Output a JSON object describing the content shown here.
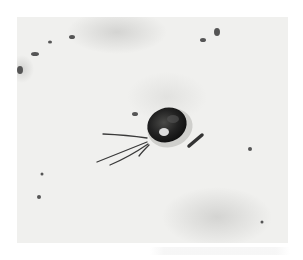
{
  "image": {
    "subject": "micrograph of a single-celled flagellated organism",
    "background_color": "#f0f0ee",
    "cell_color": "#1c1c1c",
    "halo_color": "#cfcfcc",
    "flagella_count": 4,
    "frame": {
      "x": 17,
      "y": 17,
      "width": 271,
      "height": 226
    }
  }
}
